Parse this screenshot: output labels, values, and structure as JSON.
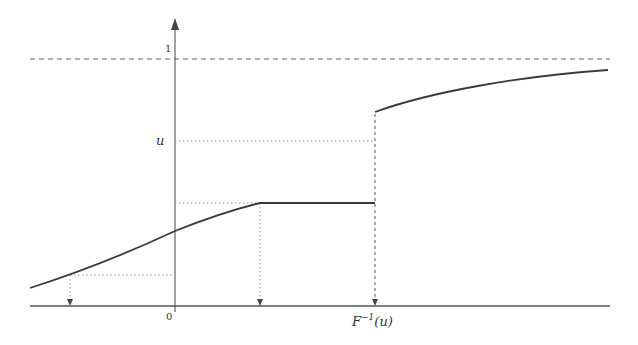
{
  "diagram": {
    "labels": {
      "one": "1",
      "u": "u",
      "zero": "0",
      "finv_F": "F",
      "finv_sup": "−1",
      "finv_arg": "(u)"
    },
    "colors": {
      "curve": "#3a3a3a",
      "axis": "#555555",
      "guide": "#8a8a8a",
      "background": "#ffffff"
    },
    "elements": [
      "y-axis with arrow",
      "x-axis",
      "dashed asymptote at level 1",
      "CDF curve F(x) with flat segment and jump",
      "dotted projection lines with downward arrows"
    ]
  }
}
